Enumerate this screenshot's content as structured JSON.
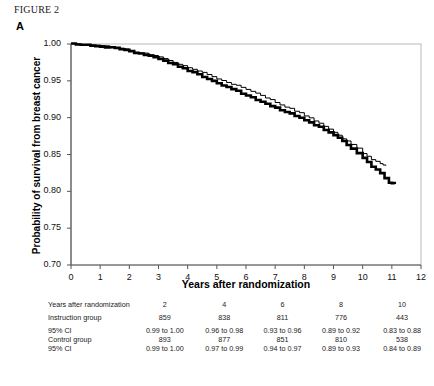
{
  "figure": {
    "label": "FIGURE 2",
    "panel": "A"
  },
  "chart_data": {
    "type": "line",
    "title": "",
    "xlabel": "Years after randomization",
    "ylabel": "Probability of survival from breast cancer",
    "xlim": [
      0,
      12
    ],
    "ylim": [
      0.7,
      1.0
    ],
    "xticks": [
      "0",
      "1",
      "2",
      "3",
      "4",
      "5",
      "6",
      "7",
      "8",
      "9",
      "10",
      "11",
      "12"
    ],
    "yticks": [
      "1.00",
      "0.95",
      "0.90",
      "0.85",
      "0.80",
      "0.75",
      "0.70"
    ],
    "grid": false,
    "legend": "none",
    "series": [
      {
        "name": "Instruction group",
        "style": "thick",
        "color": "#000000",
        "x": [
          0,
          0.5,
          1.0,
          1.5,
          2.0,
          2.5,
          3.0,
          3.5,
          4.0,
          4.5,
          5.0,
          5.5,
          6.0,
          6.5,
          7.0,
          7.5,
          8.0,
          8.5,
          9.0,
          9.3,
          9.6,
          10.0,
          10.3,
          10.6,
          10.9,
          11.1
        ],
        "y": [
          1.0,
          0.999,
          0.997,
          0.994,
          0.99,
          0.985,
          0.98,
          0.972,
          0.964,
          0.956,
          0.947,
          0.939,
          0.93,
          0.922,
          0.913,
          0.905,
          0.896,
          0.887,
          0.876,
          0.868,
          0.858,
          0.845,
          0.834,
          0.824,
          0.812,
          0.81
        ]
      },
      {
        "name": "Control group",
        "style": "thin",
        "color": "#000000",
        "x": [
          0,
          0.5,
          1.0,
          1.5,
          2.0,
          2.5,
          3.0,
          3.5,
          4.0,
          4.5,
          5.0,
          5.5,
          6.0,
          6.5,
          7.0,
          7.5,
          8.0,
          8.5,
          9.0,
          9.3,
          9.6,
          10.0,
          10.3,
          10.6,
          10.8
        ],
        "y": [
          1.0,
          0.999,
          0.998,
          0.995,
          0.991,
          0.987,
          0.982,
          0.975,
          0.968,
          0.961,
          0.953,
          0.946,
          0.938,
          0.93,
          0.921,
          0.912,
          0.903,
          0.893,
          0.88,
          0.872,
          0.864,
          0.852,
          0.843,
          0.837,
          0.835
        ]
      }
    ]
  },
  "risk_table": {
    "columns": [
      "2",
      "4",
      "6",
      "8",
      "10"
    ],
    "rows": [
      {
        "label": "Years after randomization",
        "values": [
          "2",
          "4",
          "6",
          "8",
          "10"
        ]
      },
      {
        "label": "Instruction group",
        "values": [
          "859",
          "838",
          "811",
          "776",
          "443"
        ]
      },
      {
        "label": "95% CI",
        "values": [
          "0.99 to 1.00",
          "0.96 to 0.98",
          "0.93 to 0.96",
          "0.89 to 0.92",
          "0.83 to 0.88"
        ]
      },
      {
        "label": "Control group",
        "values": [
          "893",
          "877",
          "851",
          "810",
          "538"
        ]
      },
      {
        "label": "95% CI",
        "values": [
          "0.99 to 1.00",
          "0.97 to 0.99",
          "0.94 to 0.97",
          "0.89 to 0.93",
          "0.84 to 0.89"
        ]
      }
    ]
  }
}
